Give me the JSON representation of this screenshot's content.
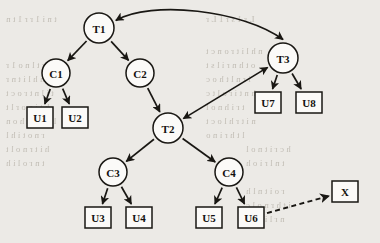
{
  "figure": {
    "type": "directed-graph",
    "title": "",
    "background_color": "#eceae6",
    "ink_color": "#191713",
    "node_fill": "#fbfaf8"
  },
  "nodes": [
    {
      "id": "T1",
      "label": "T1",
      "shape": "circle",
      "cx": 99,
      "cy": 28,
      "r": 15
    },
    {
      "id": "T2",
      "label": "T2",
      "shape": "circle",
      "cx": 168,
      "cy": 128,
      "r": 15
    },
    {
      "id": "T3",
      "label": "T3",
      "shape": "circle",
      "cx": 283,
      "cy": 58,
      "r": 15
    },
    {
      "id": "C1",
      "label": "C1",
      "shape": "circle",
      "cx": 56,
      "cy": 73,
      "r": 14
    },
    {
      "id": "C2",
      "label": "C2",
      "shape": "circle",
      "cx": 140,
      "cy": 73,
      "r": 14
    },
    {
      "id": "C3",
      "label": "C3",
      "shape": "circle",
      "cx": 113,
      "cy": 172,
      "r": 14
    },
    {
      "id": "C4",
      "label": "C4",
      "shape": "circle",
      "cx": 229,
      "cy": 172,
      "r": 14
    },
    {
      "id": "U1",
      "label": "U1",
      "shape": "rect",
      "x": 27,
      "y": 107,
      "w": 26,
      "h": 21
    },
    {
      "id": "U2",
      "label": "U2",
      "shape": "rect",
      "x": 62,
      "y": 107,
      "w": 26,
      "h": 21
    },
    {
      "id": "U3",
      "label": "U3",
      "shape": "rect",
      "x": 85,
      "y": 207,
      "w": 26,
      "h": 21
    },
    {
      "id": "U4",
      "label": "U4",
      "shape": "rect",
      "x": 126,
      "y": 207,
      "w": 26,
      "h": 21
    },
    {
      "id": "U5",
      "label": "U5",
      "shape": "rect",
      "x": 196,
      "y": 207,
      "w": 26,
      "h": 21
    },
    {
      "id": "U6",
      "label": "U6",
      "shape": "rect",
      "x": 238,
      "y": 207,
      "w": 26,
      "h": 21
    },
    {
      "id": "U7",
      "label": "U7",
      "shape": "rect",
      "x": 255,
      "y": 92,
      "w": 26,
      "h": 21
    },
    {
      "id": "U8",
      "label": "U8",
      "shape": "rect",
      "x": 296,
      "y": 92,
      "w": 26,
      "h": 21
    },
    {
      "id": "X",
      "label": "X",
      "shape": "rect",
      "x": 332,
      "y": 181,
      "w": 26,
      "h": 21
    }
  ],
  "edges": [
    {
      "from": "T1",
      "to": "C1",
      "style": "solid",
      "arrow": "end"
    },
    {
      "from": "T1",
      "to": "C2",
      "style": "solid",
      "arrow": "end"
    },
    {
      "from": "C1",
      "to": "U1",
      "style": "solid",
      "arrow": "end"
    },
    {
      "from": "C1",
      "to": "U2",
      "style": "solid",
      "arrow": "end"
    },
    {
      "from": "C2",
      "to": "T2",
      "style": "solid",
      "arrow": "end"
    },
    {
      "from": "T2",
      "to": "C3",
      "style": "solid",
      "arrow": "end"
    },
    {
      "from": "T2",
      "to": "C4",
      "style": "solid",
      "arrow": "end"
    },
    {
      "from": "C3",
      "to": "U3",
      "style": "solid",
      "arrow": "end"
    },
    {
      "from": "C3",
      "to": "U4",
      "style": "solid",
      "arrow": "end"
    },
    {
      "from": "C4",
      "to": "U5",
      "style": "solid",
      "arrow": "end"
    },
    {
      "from": "C4",
      "to": "U6",
      "style": "solid",
      "arrow": "end"
    },
    {
      "from": "T3",
      "to": "U7",
      "style": "solid",
      "arrow": "end"
    },
    {
      "from": "T3",
      "to": "U8",
      "style": "solid",
      "arrow": "end"
    },
    {
      "from": "T2",
      "to": "T3",
      "style": "solid",
      "arrow": "both"
    },
    {
      "from": "T3",
      "to": "T1",
      "style": "curved",
      "arrow": "both"
    },
    {
      "from": "U6",
      "to": "X",
      "style": "dashed",
      "arrow": "end"
    }
  ],
  "background_text": {
    "note": "faint scanned show-through text behind figure, illegible",
    "lines": [
      {
        "text": "t n i 1 r r 1 t n",
        "x": 6,
        "y": 14
      },
      {
        "text": "r t l n o 1 r",
        "x": 6,
        "y": 60
      },
      {
        "text": "n t h h l i t n r",
        "x": 6,
        "y": 74
      },
      {
        "text": "t i l n t r o c t",
        "x": 6,
        "y": 88
      },
      {
        "text": "h t i n o r l t",
        "x": 6,
        "y": 102
      },
      {
        "text": "l n t r i t h o n",
        "x": 6,
        "y": 116
      },
      {
        "text": "r n o t i h l",
        "x": 6,
        "y": 130
      },
      {
        "text": "h i t r n o l t",
        "x": 6,
        "y": 144
      },
      {
        "text": "t n r o l i h",
        "x": 6,
        "y": 158
      },
      {
        "text": "L r 1 s r 1 L r",
        "x": 206,
        "y": 14
      },
      {
        "text": "n h l i t r o n c t",
        "x": 206,
        "y": 46
      },
      {
        "text": "o t h n r i l s t",
        "x": 206,
        "y": 60
      },
      {
        "text": "i r n l t h o c",
        "x": 206,
        "y": 74
      },
      {
        "text": "h n t i r o l t c",
        "x": 206,
        "y": 88
      },
      {
        "text": "t r i h n o l",
        "x": 206,
        "y": 102
      },
      {
        "text": "n i t r h l o c t",
        "x": 206,
        "y": 116
      },
      {
        "text": "l t h r i n o",
        "x": 206,
        "y": 130
      },
      {
        "text": "h c r i t n o l",
        "x": 246,
        "y": 144
      },
      {
        "text": "t n l r i o h",
        "x": 246,
        "y": 158
      },
      {
        "text": "r o i t n l h",
        "x": 246,
        "y": 186
      },
      {
        "text": "i t h r n o l c",
        "x": 246,
        "y": 200
      },
      {
        "text": "n r l i t o h",
        "x": 246,
        "y": 214
      }
    ]
  }
}
